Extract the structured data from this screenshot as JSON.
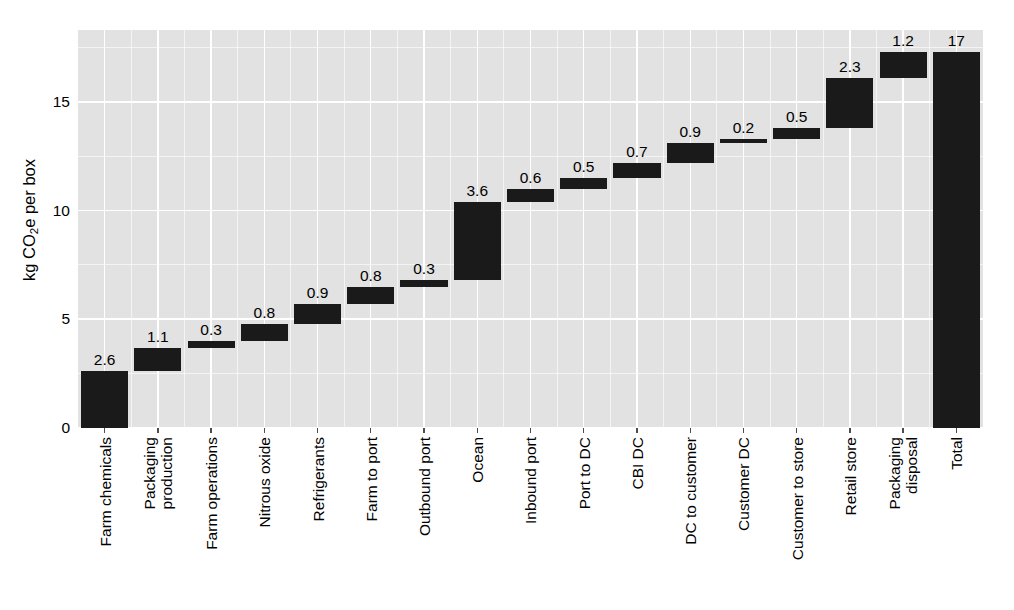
{
  "chart_data": {
    "type": "bar",
    "subtype": "waterfall",
    "title": "",
    "subtitle": "",
    "xlabel": "",
    "ylabel": "kg CO2e per box",
    "ylabel_parts": {
      "pre": "kg CO",
      "sub": "2",
      "post": "e per box"
    },
    "ylim": [
      0,
      18.3
    ],
    "yticks": [
      0,
      5,
      10,
      15
    ],
    "ytick_labels": [
      "0",
      "5",
      "10",
      "15"
    ],
    "grid": true,
    "grid_major_color": "#ffffff",
    "panel_color": "#e2e2e2",
    "bar_color": "#1a1a1a",
    "legend": "none",
    "categories": [
      "Farm chemicals",
      "Packaging production",
      "Farm operations",
      "Nitrous oxide",
      "Refrigerants",
      "Farm to port",
      "Outbound port",
      "Ocean",
      "Inbound port",
      "Port to DC",
      "CBI DC",
      "DC to customer",
      "Customer DC",
      "Customer to store",
      "Retail store",
      "Packaging disposal",
      "Total"
    ],
    "category_lines": [
      [
        "Farm chemicals"
      ],
      [
        "Packaging",
        "production"
      ],
      [
        "Farm operations"
      ],
      [
        "Nitrous oxide"
      ],
      [
        "Refrigerants"
      ],
      [
        "Farm to port"
      ],
      [
        "Outbound port"
      ],
      [
        "Ocean"
      ],
      [
        "Inbound port"
      ],
      [
        "Port to DC"
      ],
      [
        "CBI DC"
      ],
      [
        "DC to customer"
      ],
      [
        "Customer DC"
      ],
      [
        "Customer to store"
      ],
      [
        "Retail store"
      ],
      [
        "Packaging",
        "disposal"
      ],
      [
        "Total"
      ]
    ],
    "values": [
      2.6,
      1.1,
      0.3,
      0.8,
      0.9,
      0.8,
      0.3,
      3.6,
      0.6,
      0.5,
      0.7,
      0.9,
      0.2,
      0.5,
      2.3,
      1.2,
      17
    ],
    "value_labels": [
      "2.6",
      "1.1",
      "0.3",
      "0.8",
      "0.9",
      "0.8",
      "0.3",
      "3.6",
      "0.6",
      "0.5",
      "0.7",
      "0.9",
      "0.2",
      "0.5",
      "2.3",
      "1.2",
      "17"
    ],
    "bars": [
      {
        "label": "Farm chemicals",
        "value_label": "2.6",
        "value": 2.6,
        "base": 0.0,
        "top": 2.6,
        "is_total": false
      },
      {
        "label": "Packaging production",
        "value_label": "1.1",
        "value": 1.1,
        "base": 2.6,
        "top": 3.7,
        "is_total": false
      },
      {
        "label": "Farm operations",
        "value_label": "0.3",
        "value": 0.3,
        "base": 3.7,
        "top": 4.0,
        "is_total": false
      },
      {
        "label": "Nitrous oxide",
        "value_label": "0.8",
        "value": 0.8,
        "base": 4.0,
        "top": 4.8,
        "is_total": false
      },
      {
        "label": "Refrigerants",
        "value_label": "0.9",
        "value": 0.9,
        "base": 4.8,
        "top": 5.7,
        "is_total": false
      },
      {
        "label": "Farm to port",
        "value_label": "0.8",
        "value": 0.8,
        "base": 5.7,
        "top": 6.5,
        "is_total": false
      },
      {
        "label": "Outbound port",
        "value_label": "0.3",
        "value": 0.3,
        "base": 6.5,
        "top": 6.8,
        "is_total": false
      },
      {
        "label": "Ocean",
        "value_label": "3.6",
        "value": 3.6,
        "base": 6.8,
        "top": 10.4,
        "is_total": false
      },
      {
        "label": "Inbound port",
        "value_label": "0.6",
        "value": 0.6,
        "base": 10.4,
        "top": 11.0,
        "is_total": false
      },
      {
        "label": "Port to DC",
        "value_label": "0.5",
        "value": 0.5,
        "base": 11.0,
        "top": 11.5,
        "is_total": false
      },
      {
        "label": "CBI DC",
        "value_label": "0.7",
        "value": 0.7,
        "base": 11.5,
        "top": 12.2,
        "is_total": false
      },
      {
        "label": "DC to customer",
        "value_label": "0.9",
        "value": 0.9,
        "base": 12.2,
        "top": 13.1,
        "is_total": false
      },
      {
        "label": "Customer DC",
        "value_label": "0.2",
        "value": 0.2,
        "base": 13.1,
        "top": 13.3,
        "is_total": false
      },
      {
        "label": "Customer to store",
        "value_label": "0.5",
        "value": 0.5,
        "base": 13.3,
        "top": 13.8,
        "is_total": false
      },
      {
        "label": "Retail store",
        "value_label": "2.3",
        "value": 2.3,
        "base": 13.8,
        "top": 16.1,
        "is_total": false
      },
      {
        "label": "Packaging disposal",
        "value_label": "1.2",
        "value": 1.2,
        "base": 16.1,
        "top": 17.3,
        "is_total": false
      },
      {
        "label": "Total",
        "value_label": "17",
        "value": 17.3,
        "base": 0.0,
        "top": 17.3,
        "is_total": true
      }
    ]
  }
}
